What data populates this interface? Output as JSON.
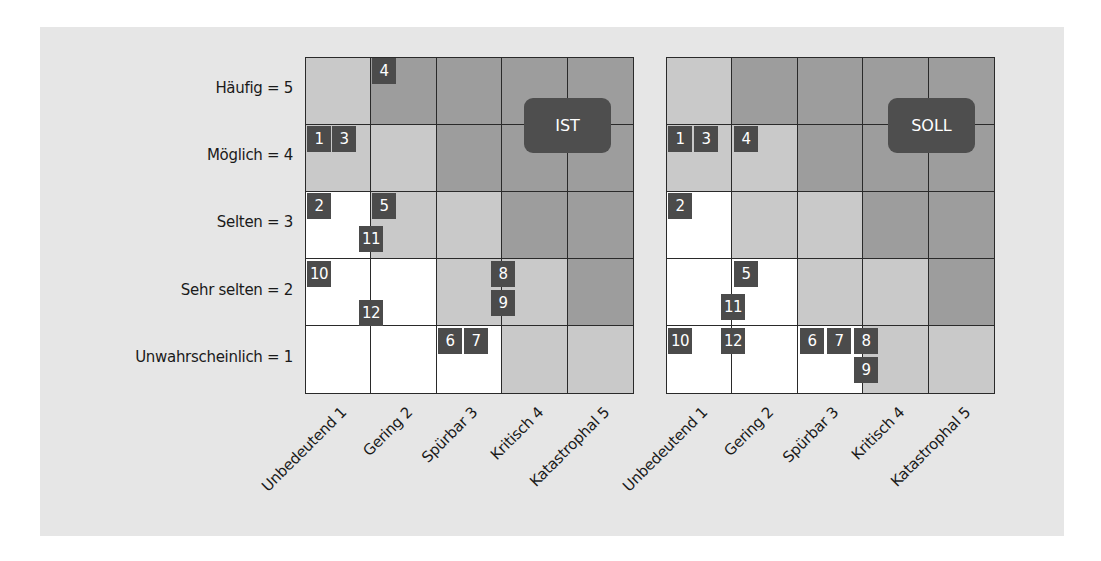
{
  "chart_data": {
    "type": "heatmap",
    "title": "",
    "ylabel": "Eintrittswahrscheinlichkeit",
    "xlabel": "Schadensausmaß",
    "y_categories": [
      "Häufig = 5",
      "Möglich = 4",
      "Selten = 3",
      "Sehr selten = 2",
      "Unwahrscheinlich = 1"
    ],
    "x_categories": [
      "Unbedeutend 1",
      "Gering 2",
      "Spürbar 3",
      "Kritisch 4",
      "Katastrophal 5"
    ],
    "zone_colors": {
      "W": "#ffffff",
      "L": "#c9c9c9",
      "M": "#9d9d9d"
    },
    "zone_grid_rows_top_to_bottom": [
      [
        "L",
        "M",
        "M",
        "M",
        "M"
      ],
      [
        "L",
        "L",
        "M",
        "M",
        "M"
      ],
      [
        "W",
        "L",
        "L",
        "M",
        "M"
      ],
      [
        "W",
        "W",
        "L",
        "L",
        "M"
      ],
      [
        "W",
        "W",
        "W",
        "L",
        "L"
      ]
    ],
    "matrices": [
      {
        "label": "IST",
        "risks": [
          {
            "id": "1",
            "likelihood": 4,
            "impact": 1
          },
          {
            "id": "3",
            "likelihood": 4,
            "impact": 1
          },
          {
            "id": "4",
            "likelihood": 5,
            "impact": 2
          },
          {
            "id": "2",
            "likelihood": 3,
            "impact": 1
          },
          {
            "id": "5",
            "likelihood": 3,
            "impact": 2
          },
          {
            "id": "11",
            "likelihood": 3,
            "impact": 1.5
          },
          {
            "id": "10",
            "likelihood": 2,
            "impact": 1
          },
          {
            "id": "12",
            "likelihood": 2,
            "impact": 1.5
          },
          {
            "id": "8",
            "likelihood": 2,
            "impact": 3.5
          },
          {
            "id": "9",
            "likelihood": 2,
            "impact": 3.5
          },
          {
            "id": "6",
            "likelihood": 1,
            "impact": 3
          },
          {
            "id": "7",
            "likelihood": 1,
            "impact": 3
          }
        ]
      },
      {
        "label": "SOLL",
        "risks": [
          {
            "id": "1",
            "likelihood": 4,
            "impact": 1
          },
          {
            "id": "3",
            "likelihood": 4,
            "impact": 1
          },
          {
            "id": "4",
            "likelihood": 4,
            "impact": 2
          },
          {
            "id": "2",
            "likelihood": 3,
            "impact": 1
          },
          {
            "id": "5",
            "likelihood": 2,
            "impact": 2
          },
          {
            "id": "11",
            "likelihood": 2,
            "impact": 1.5
          },
          {
            "id": "10",
            "likelihood": 1,
            "impact": 1
          },
          {
            "id": "12",
            "likelihood": 1,
            "impact": 1.5
          },
          {
            "id": "6",
            "likelihood": 1,
            "impact": 3
          },
          {
            "id": "7",
            "likelihood": 1,
            "impact": 3
          },
          {
            "id": "8",
            "likelihood": 1,
            "impact": 3.5
          },
          {
            "id": "9",
            "likelihood": 1,
            "impact": 3.5
          }
        ]
      }
    ]
  },
  "ylabels": [
    "Häufig = 5",
    "Möglich = 4",
    "Selten = 3",
    "Sehr selten = 2",
    "Unwahrscheinlich = 1"
  ],
  "xlabels": [
    "Unbedeutend 1",
    "Gering 2",
    "Spürbar 3",
    "Kritisch 4",
    "Katastrophal 5"
  ],
  "ist": {
    "tag": "IST",
    "badges": [
      {
        "n": "4",
        "x": 66,
        "y": 0
      },
      {
        "n": "1",
        "x": 1,
        "y": 68
      },
      {
        "n": "3",
        "x": 26,
        "y": 68
      },
      {
        "n": "2",
        "x": 1,
        "y": 135
      },
      {
        "n": "5",
        "x": 66,
        "y": 135
      },
      {
        "n": "11",
        "x": 53,
        "y": 168
      },
      {
        "n": "10",
        "x": 1,
        "y": 203
      },
      {
        "n": "8",
        "x": 185,
        "y": 203
      },
      {
        "n": "9",
        "x": 185,
        "y": 232
      },
      {
        "n": "12",
        "x": 53,
        "y": 242
      },
      {
        "n": "6",
        "x": 132,
        "y": 270
      },
      {
        "n": "7",
        "x": 158,
        "y": 270
      }
    ]
  },
  "soll": {
    "tag": "SOLL",
    "badges": [
      {
        "n": "1",
        "x": 1,
        "y": 68
      },
      {
        "n": "3",
        "x": 27,
        "y": 68
      },
      {
        "n": "4",
        "x": 67,
        "y": 68
      },
      {
        "n": "2",
        "x": 1,
        "y": 135
      },
      {
        "n": "5",
        "x": 67,
        "y": 203
      },
      {
        "n": "11",
        "x": 54,
        "y": 236
      },
      {
        "n": "10",
        "x": 1,
        "y": 270
      },
      {
        "n": "12",
        "x": 54,
        "y": 270
      },
      {
        "n": "6",
        "x": 133,
        "y": 270
      },
      {
        "n": "7",
        "x": 160,
        "y": 270
      },
      {
        "n": "8",
        "x": 187,
        "y": 270
      },
      {
        "n": "9",
        "x": 187,
        "y": 299
      }
    ]
  }
}
